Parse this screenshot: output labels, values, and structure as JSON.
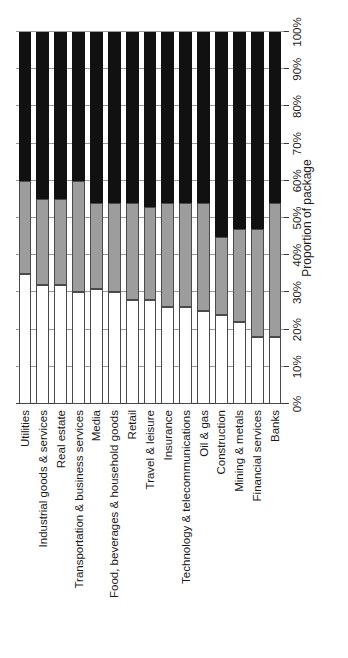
{
  "chart_data": {
    "type": "bar",
    "orientation": "horizontal-stacked",
    "title": "",
    "xlabel": "Proportion of package",
    "ylabel": "",
    "xlim": [
      0,
      100
    ],
    "grid": true,
    "legend_position": "none",
    "stacked": true,
    "units": "%",
    "tick_labels": [
      "0%",
      "10%",
      "20%",
      "30%",
      "40%",
      "50%",
      "60%",
      "70%",
      "80%",
      "90%",
      "100%"
    ],
    "tick_values": [
      0,
      10,
      20,
      30,
      40,
      50,
      60,
      70,
      80,
      90,
      100
    ],
    "categories": [
      "Utilities",
      "Industrial goods & services",
      "Real estate",
      "Transportation & business services",
      "Media",
      "Food, beverages & household goods",
      "Retail",
      "Travel & leisure",
      "Insurance",
      "Technology & telecommunications",
      "Oil & gas",
      "Construction",
      "Mining & metals",
      "Financial services",
      "Banks"
    ],
    "series": [
      {
        "name": "segment-1",
        "color": "#ffffff",
        "values": [
          35,
          32,
          32,
          30,
          31,
          30,
          28,
          28,
          26,
          26,
          25,
          24,
          22,
          18,
          18
        ]
      },
      {
        "name": "segment-2",
        "color": "#9d9d9d",
        "values": [
          25,
          23,
          23,
          30,
          23,
          24,
          26,
          25,
          28,
          28,
          29,
          21,
          25,
          29,
          36
        ]
      },
      {
        "name": "segment-3",
        "color": "#111111",
        "values": [
          40,
          45,
          45,
          40,
          46,
          46,
          46,
          47,
          46,
          46,
          46,
          55,
          53,
          53,
          46
        ]
      }
    ]
  },
  "axis": {
    "value_axis_title": "Proportion of package"
  }
}
